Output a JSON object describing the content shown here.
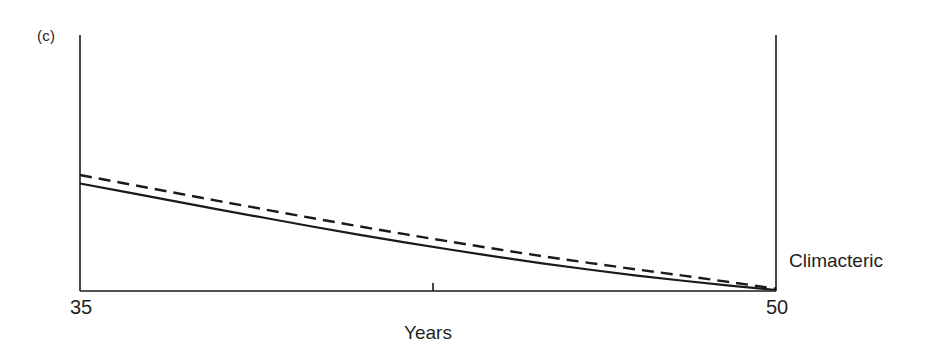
{
  "figure": {
    "panel_label": "(c)",
    "background_color": "#ffffff",
    "line_color": "#1a1a1a"
  },
  "chart_data": {
    "type": "line",
    "title": "(c)",
    "xlabel": "Years",
    "ylabel": "",
    "xlim": [
      35,
      50
    ],
    "ylim": [
      0,
      100
    ],
    "grid": false,
    "legend_position": "none",
    "xticks": [
      35,
      42.5,
      50
    ],
    "xticklabels": [
      "35",
      "",
      "50"
    ],
    "annotations": [
      {
        "text": "Climacteric",
        "x": 50,
        "y": 11,
        "placement": "right-of-axis"
      }
    ],
    "axes": {
      "left_spine": true,
      "right_spine": true,
      "bottom_spine": true,
      "top_spine": false,
      "midpoint_tick": true
    },
    "x": [
      35,
      36,
      37,
      38,
      39,
      40,
      41,
      42,
      43,
      44,
      45,
      46,
      47,
      48,
      49,
      50
    ],
    "series": [
      {
        "name": "solid-curve",
        "style": "solid",
        "color": "#1a1a1a",
        "values": [
          42.0,
          38.6,
          35.2,
          31.8,
          28.5,
          25.2,
          22.0,
          19.0,
          16.1,
          13.3,
          10.7,
          8.3,
          6.0,
          4.0,
          2.1,
          0.4
        ]
      },
      {
        "name": "dashed-curve",
        "style": "dashed",
        "color": "#1a1a1a",
        "dash_pattern": [
          12,
          7
        ],
        "values": [
          45.3,
          41.9,
          38.5,
          35.1,
          31.8,
          28.5,
          25.3,
          22.2,
          19.2,
          16.3,
          13.5,
          10.9,
          8.4,
          6.0,
          3.5,
          0.9
        ]
      }
    ]
  }
}
